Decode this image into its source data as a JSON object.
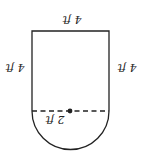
{
  "diagram": {
    "labels": {
      "top": "4 ft",
      "left": "4 ft",
      "right": "4 ft",
      "radius": "2 ft"
    },
    "colors": {
      "stroke": "#222222",
      "background": "#ffffff"
    }
  }
}
